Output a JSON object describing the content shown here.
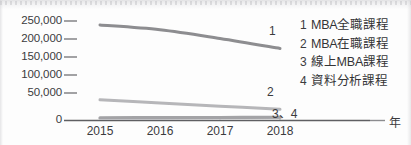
{
  "chart_data": {
    "type": "line",
    "title": "",
    "xlabel": "年",
    "ylabel": "",
    "x": [
      "2015",
      "2016",
      "2017",
      "2018"
    ],
    "categories": [
      "2015",
      "2016",
      "2017",
      "2018"
    ],
    "ylim": [
      0,
      250000
    ],
    "yticks": [
      0,
      50000,
      100000,
      150000,
      200000,
      250000
    ],
    "ytick_labels": [
      "0",
      "50,000",
      "100,000",
      "150,000",
      "200,000",
      "250,000"
    ],
    "grid": false,
    "legend_position": "right",
    "series": [
      {
        "key": "1",
        "name": "MBA全職課程",
        "values": [
          240000,
          228000,
          206000,
          181000
        ],
        "color": "#8d8d90",
        "end_label": "1"
      },
      {
        "key": "2",
        "name": "MBA在職課程",
        "values": [
          52000,
          44000,
          36000,
          28000
        ],
        "color": "#b6b6b9",
        "end_label": "2"
      },
      {
        "key": "3",
        "name": "線上MBA課程",
        "values": [
          7000,
          7200,
          7600,
          8200
        ],
        "color": "#a3a3a6",
        "end_label": "3、4"
      },
      {
        "key": "4",
        "name": "資料分析課程",
        "values": [
          5000,
          5400,
          6000,
          6800
        ],
        "color": "#c9c9cc",
        "end_label": ""
      }
    ]
  },
  "axes": {
    "y_tick_labels": [
      "250,000",
      "200,000",
      "150,000",
      "100,000",
      "50,000",
      "0"
    ],
    "x_tick_labels": [
      "2015",
      "2016",
      "2017",
      "2018"
    ],
    "x_axis_name": "年"
  },
  "series_tags": {
    "one": "1",
    "two": "2",
    "three_four": "3、4"
  },
  "legend": {
    "items": [
      {
        "key": "1",
        "label": "MBA全職課程"
      },
      {
        "key": "2",
        "label": "MBA在職課程"
      },
      {
        "key": "3",
        "label": "線上MBA課程"
      },
      {
        "key": "4",
        "label": "資料分析課程"
      }
    ]
  },
  "colors": {
    "ink": "#3b3b3d",
    "axis": "#6f6f72",
    "series1": "#8d8d90",
    "series2": "#b6b6b9",
    "series3": "#a3a3a6",
    "series4": "#c9c9cc",
    "page": "#fdfdfd"
  }
}
